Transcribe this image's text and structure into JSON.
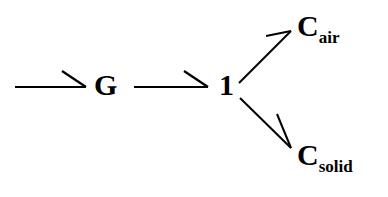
{
  "diagram": {
    "type": "bond-graph",
    "background_color": "#ffffff",
    "stroke_color": "#000000",
    "text_color": "#000000",
    "nodes": [
      {
        "id": "g",
        "base": "G",
        "subscript": "",
        "name": "gyrator-or-gain-node"
      },
      {
        "id": "one",
        "base": "1",
        "subscript": "",
        "name": "one-junction-node"
      },
      {
        "id": "c_air",
        "base": "C",
        "subscript": "air",
        "name": "capacitance-air-node"
      },
      {
        "id": "c_solid",
        "base": "C",
        "subscript": "solid",
        "name": "capacitance-solid-node"
      }
    ],
    "edges": [
      {
        "id": "input-to-g",
        "from": "",
        "to": "G",
        "label": "",
        "arrow_style": "half-arrow"
      },
      {
        "id": "g-to-one",
        "from": "G",
        "to": "1",
        "label": "",
        "arrow_style": "half-arrow"
      },
      {
        "id": "one-to-c-air",
        "from": "1",
        "to": "C_air",
        "label": "",
        "arrow_style": "half-arrow"
      },
      {
        "id": "one-to-c-solid",
        "from": "1",
        "to": "C_solid",
        "label": "",
        "arrow_style": "half-arrow"
      }
    ]
  }
}
